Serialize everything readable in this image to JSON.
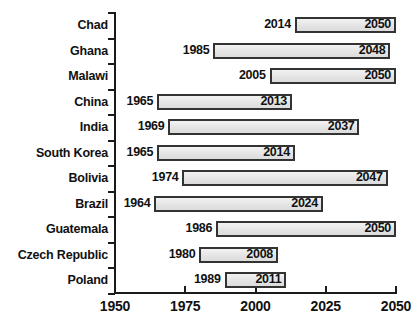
{
  "chart_data": {
    "type": "bar",
    "subtype": "range-bar",
    "title": "",
    "subtitle": "",
    "xlabel": "",
    "ylabel": "",
    "xlim": [
      1950,
      2050
    ],
    "xticks": [
      1950,
      1975,
      2000,
      2025,
      2050
    ],
    "xtick_labels": [
      "1950",
      "1975",
      "2000",
      "2025",
      "2050"
    ],
    "grid": false,
    "legend": null,
    "categories": [
      "Chad",
      "Ghana",
      "Malawi",
      "China",
      "India",
      "South Korea",
      "Bolivia",
      "Brazil",
      "Guatemala",
      "Czech Republic",
      "Poland"
    ],
    "bars": [
      {
        "category": "Chad",
        "start": 2014,
        "end": 2050,
        "start_label": "2014",
        "end_label": "2050"
      },
      {
        "category": "Ghana",
        "start": 1985,
        "end": 2048,
        "start_label": "1985",
        "end_label": "2048"
      },
      {
        "category": "Malawi",
        "start": 2005,
        "end": 2050,
        "start_label": "2005",
        "end_label": "2050"
      },
      {
        "category": "China",
        "start": 1965,
        "end": 2013,
        "start_label": "1965",
        "end_label": "2013"
      },
      {
        "category": "India",
        "start": 1969,
        "end": 2037,
        "start_label": "1969",
        "end_label": "2037"
      },
      {
        "category": "South Korea",
        "start": 1965,
        "end": 2014,
        "start_label": "1965",
        "end_label": "2014"
      },
      {
        "category": "Bolivia",
        "start": 1974,
        "end": 2047,
        "start_label": "1974",
        "end_label": "2047"
      },
      {
        "category": "Brazil",
        "start": 1964,
        "end": 2024,
        "start_label": "1964",
        "end_label": "2024"
      },
      {
        "category": "Guatemala",
        "start": 1986,
        "end": 2050,
        "start_label": "1986",
        "end_label": "2050"
      },
      {
        "category": "Czech Republic",
        "start": 1980,
        "end": 2008,
        "start_label": "1980",
        "end_label": "2008"
      },
      {
        "category": "Poland",
        "start": 1989,
        "end": 2011,
        "start_label": "1989",
        "end_label": "2011"
      }
    ],
    "colors": {
      "bar_fill": "#e6e6e6",
      "bar_border": "#333333",
      "axis": "#1a1a1a",
      "text": "#111111",
      "background": "#ffffff"
    }
  }
}
